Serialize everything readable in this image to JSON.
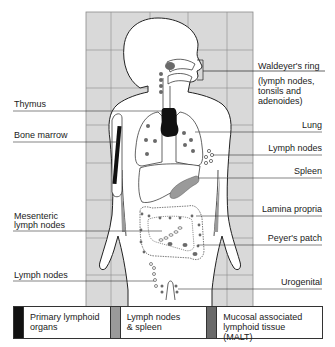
{
  "diagram": {
    "colors": {
      "background_grid": "#d9d9d9",
      "grid_lines": "#8a8a8a",
      "primary": "#111111",
      "lymph_nodes_spleen": "#9a9a9a",
      "malt": "#6a6a6a",
      "outline": "#222222"
    },
    "labels_left": {
      "thymus": "Thymus",
      "bone_marrow": "Bone marrow",
      "mesenteric_1": "Mesenteric",
      "mesenteric_2": "lymph nodes",
      "lymph_nodes_lower": "Lymph nodes"
    },
    "labels_right": {
      "waldeyer": "Waldeyer's ring",
      "waldeyer_sub_1": "(lymph nodes,",
      "waldeyer_sub_2": "tonsils and",
      "waldeyer_sub_3": "adenoides)",
      "lung": "Lung",
      "lymph_nodes": "Lymph nodes",
      "spleen": "Spleen",
      "lamina_propria": "Lamina propria",
      "peyers_patch": "Peyer's patch",
      "urogenital": "Urogenital"
    },
    "legend": [
      {
        "label": "Primary lymphoid\norgans",
        "color": "#111111"
      },
      {
        "label": "Lymph nodes\n& spleen",
        "color": "#9a9a9a"
      },
      {
        "label": "Mucosal associated\nlymphoid tissue (MALT)",
        "color": "#6a6a6a"
      }
    ]
  }
}
